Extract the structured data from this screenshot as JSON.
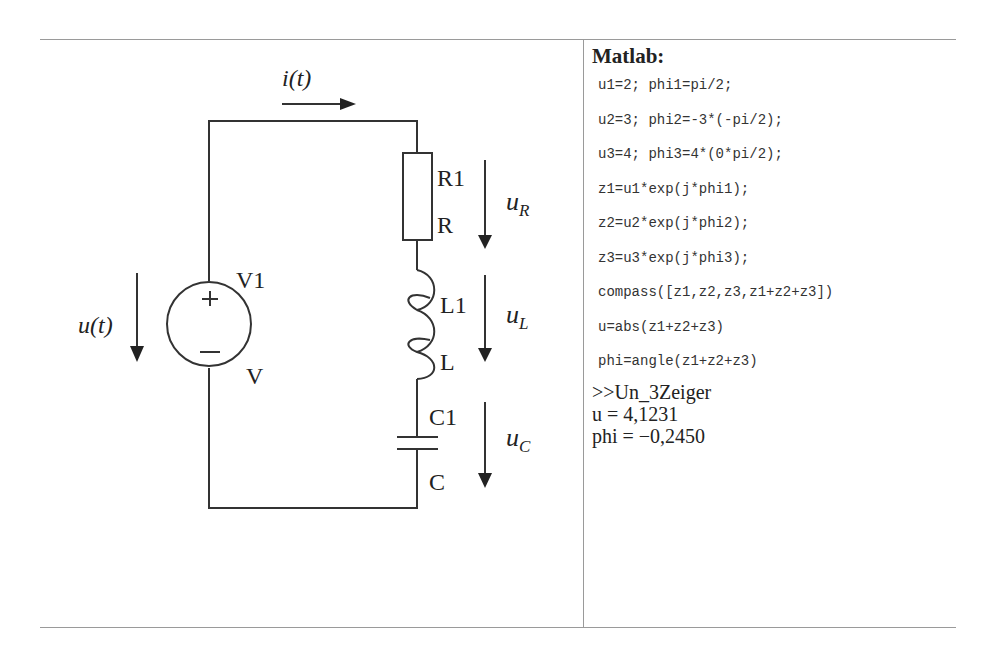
{
  "diagram": {
    "current_label": "i(t)",
    "source_voltage_label": "u(t)",
    "source": {
      "name": "V1",
      "value": "V",
      "plus": "+",
      "minus": "−"
    },
    "resistor": {
      "name": "R1",
      "value": "R",
      "voltage_main": "u",
      "voltage_sub": "R"
    },
    "inductor": {
      "name": "L1",
      "value": "L",
      "voltage_main": "u",
      "voltage_sub": "L"
    },
    "capacitor": {
      "name": "C1",
      "value": "C",
      "voltage_main": "u",
      "voltage_sub": "C"
    }
  },
  "matlab": {
    "title": "Matlab:",
    "code_lines": [
      "u1=2; phi1=pi/2;",
      "u2=3; phi2=-3*(-pi/2);",
      "u3=4; phi3=4*(0*pi/2);",
      "z1=u1*exp(j*phi1);",
      "z2=u2*exp(j*phi2);",
      "z3=u3*exp(j*phi3);",
      "compass([z1,z2,z3,z1+z2+z3])",
      "u=abs(z1+z2+z3)",
      "phi=angle(z1+z2+z3)"
    ],
    "output_lines": [
      ">>Un_3Zeiger",
      "u = 4,1231",
      "phi = −0,2450"
    ]
  }
}
